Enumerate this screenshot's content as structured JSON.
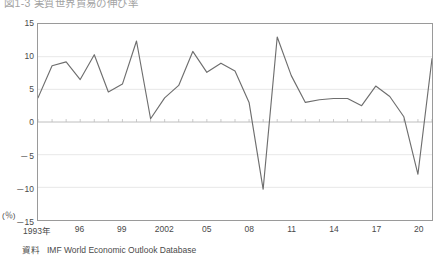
{
  "title": "図1-3  実質世界貿易の伸び率",
  "y_unit": "(％)",
  "source": {
    "label": "資料",
    "text": "IMF World Economic Outlook Database"
  },
  "axis": {
    "y_ticks": [
      "15",
      "10",
      "5",
      "0",
      "－5",
      "－10",
      "－15"
    ],
    "x_ticks": [
      "1993年",
      "96",
      "99",
      "2002",
      "05",
      "08",
      "11",
      "14",
      "17",
      "20"
    ]
  },
  "style": {
    "line_color": "#6e6e6e",
    "frame_color": "#9a9a9a",
    "grid_color": "#e2e2e2",
    "zero_line_color": "#bdbdbd",
    "text_color": "#4a4a4a"
  },
  "chart_data": {
    "type": "line",
    "title": "図1-3  実質世界貿易の伸び率",
    "xlabel": "",
    "ylabel": "(％)",
    "ylim": [
      -15,
      15
    ],
    "xlim": [
      1993,
      2021
    ],
    "grid": true,
    "legend": false,
    "yticks": [
      15,
      10,
      5,
      0,
      -5,
      -10,
      -15
    ],
    "xtick_years": [
      1993,
      1996,
      1999,
      2002,
      2005,
      2008,
      2011,
      2014,
      2017,
      2020
    ],
    "x": [
      1993,
      1994,
      1995,
      1996,
      1997,
      1998,
      1999,
      2000,
      2001,
      2002,
      2003,
      2004,
      2005,
      2006,
      2007,
      2008,
      2009,
      2010,
      2011,
      2012,
      2013,
      2014,
      2015,
      2016,
      2017,
      2018,
      2019,
      2020,
      2021
    ],
    "series": [
      {
        "name": "実質世界貿易の伸び率",
        "values": [
          3.7,
          8.6,
          9.2,
          6.5,
          10.3,
          4.6,
          5.8,
          12.4,
          0.5,
          3.7,
          5.6,
          10.8,
          7.6,
          9.0,
          7.8,
          3.0,
          -10.3,
          13.0,
          7.1,
          3.0,
          3.4,
          3.6,
          3.6,
          2.5,
          5.5,
          3.9,
          0.8,
          -8.0,
          9.7
        ]
      }
    ]
  }
}
